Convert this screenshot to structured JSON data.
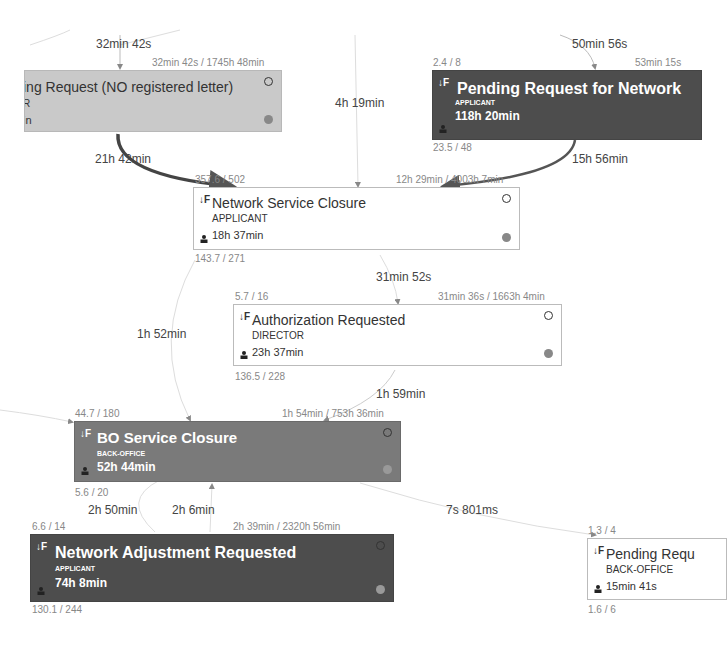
{
  "nodes": [
    {
      "id": "pending-no-letter",
      "title": "ing Request (NO registered letter)",
      "role": "R",
      "duration": "in",
      "stat_top_right": "32min 42s / 1745h 48min",
      "style": "grey"
    },
    {
      "id": "pending-network",
      "title": "Pending Request for Network",
      "role": "APPLICANT",
      "duration": "118h 20min",
      "stat_top_left": "2.4 / 8",
      "stat_top_right": "53min 15s",
      "stat_bottom_left": "23.5 / 48",
      "style": "dark"
    },
    {
      "id": "network-service-closure",
      "title": "Network Service Closure",
      "role": "APPLICANT",
      "duration": "18h 37min",
      "stat_top_left": "357.6 / 502",
      "stat_top_right": "12h 29min / 4003h 7min",
      "stat_bottom_left": "143.7 / 271",
      "style": "light"
    },
    {
      "id": "authorization-requested",
      "title": "Authorization Requested",
      "role": "DIRECTOR",
      "duration": "23h 37min",
      "stat_top_left": "5.7 / 16",
      "stat_top_right": "31min 36s / 1663h 4min",
      "stat_bottom_left": "136.5 / 228",
      "style": "light"
    },
    {
      "id": "bo-service-closure",
      "title": "BO Service Closure",
      "role": "BACK-OFFICE",
      "duration": "52h 44min",
      "stat_top_left": "44.7 / 180",
      "stat_top_right": "1h 54min / 753h 36min",
      "stat_bottom_left": "5.6 / 20",
      "style": "mid"
    },
    {
      "id": "network-adjustment-requested",
      "title": "Network Adjustment Requested",
      "role": "APPLICANT",
      "duration": "74h 8min",
      "stat_top_left": "6.6 / 14",
      "stat_top_right": "2h 39min / 2320h 56min",
      "stat_bottom_left": "130.1 / 244",
      "style": "dark"
    },
    {
      "id": "pending-request-bo",
      "title": "Pending Requ",
      "role": "BACK-OFFICE",
      "duration": "15min 41s",
      "stat_top_left": "1.3 / 4",
      "stat_bottom_left": "1.6 / 6",
      "style": "light"
    }
  ],
  "edges": [
    {
      "label": "32min 42s"
    },
    {
      "label": "50min 56s"
    },
    {
      "label": "4h 19min"
    },
    {
      "label": "21h 42min"
    },
    {
      "label": "15h 56min"
    },
    {
      "label": "31min 52s"
    },
    {
      "label": "1h 52min"
    },
    {
      "label": "1h 59min"
    },
    {
      "label": "2h 50min"
    },
    {
      "label": "2h 6min"
    },
    {
      "label": "7s 801ms"
    }
  ],
  "icons": {
    "sort": "sort-icon",
    "person": "person-icon",
    "clock": "clock-icon",
    "status": "status-dot-icon"
  },
  "colors": {
    "light": "#ffffff",
    "grey": "#c9c9c9",
    "mid": "#7a7a7a",
    "dark": "#4d4d4d",
    "edge": "#444444"
  }
}
